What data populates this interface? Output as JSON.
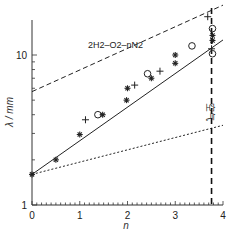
{
  "chart_data": {
    "type": "scatter",
    "title": "",
    "annotation": "2H2–O2–nN2",
    "xlabel": "n",
    "ylabel": "λ / mm",
    "xlim": [
      0,
      4
    ],
    "ylim": [
      1,
      17
    ],
    "yscale": "log",
    "x_ticks": [
      0,
      1,
      2,
      3,
      4
    ],
    "y_ticks": [
      1,
      10
    ],
    "y_tick_labels": [
      "1",
      "10"
    ],
    "x_minor_step": 0.1,
    "grid": false,
    "vertical_line": {
      "x": 3.76,
      "label": "空气",
      "style": "dashed-thick"
    },
    "lines": [
      {
        "name": "fit",
        "style": "solid",
        "points": [
          [
            0,
            1.6
          ],
          [
            4,
            12.6
          ]
        ]
      },
      {
        "name": "upper-bound",
        "style": "dashed",
        "points": [
          [
            0,
            5.7
          ],
          [
            4,
            21.5
          ]
        ]
      },
      {
        "name": "lower-bound",
        "style": "dotted",
        "points": [
          [
            0,
            1.6
          ],
          [
            4,
            3.4
          ]
        ]
      }
    ],
    "series": [
      {
        "name": "asterisk",
        "marker": "asterisk",
        "points": [
          [
            0,
            1.6
          ],
          [
            0.5,
            2.0
          ],
          [
            1.0,
            2.95
          ],
          [
            1.48,
            4.0
          ],
          [
            1.98,
            5.0
          ],
          [
            2.0,
            6.0
          ],
          [
            2.5,
            7.0
          ],
          [
            3.0,
            8.8
          ],
          [
            3.0,
            10.0
          ],
          [
            3.78,
            12.5
          ],
          [
            3.78,
            13.5
          ]
        ]
      },
      {
        "name": "plus",
        "marker": "plus",
        "points": [
          [
            1.12,
            3.7
          ],
          [
            2.15,
            6.3
          ],
          [
            2.68,
            7.8
          ],
          [
            3.68,
            18.0
          ],
          [
            3.76,
            11.0
          ]
        ]
      },
      {
        "name": "circle",
        "marker": "circle",
        "points": [
          [
            1.38,
            4.0
          ],
          [
            2.42,
            7.5
          ],
          [
            3.35,
            11.5
          ],
          [
            3.78,
            15.0
          ],
          [
            3.78,
            10.2
          ]
        ]
      }
    ]
  }
}
